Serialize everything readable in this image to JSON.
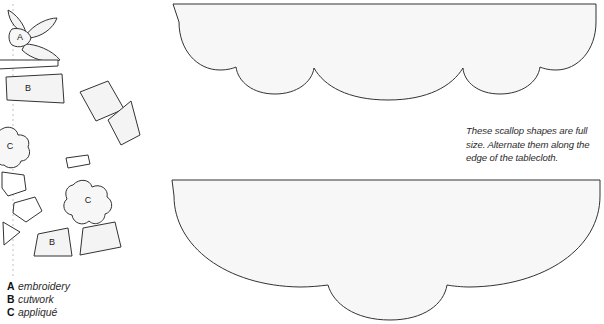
{
  "page": {
    "width": 604,
    "height": 324,
    "background": "#ffffff"
  },
  "colors": {
    "outline": "#333333",
    "shape_fill": "#f4f4f4",
    "scallop_fill": "#f7f7f7",
    "fold_line": "#cccccc",
    "text": "#2b2b2b",
    "key_text": "#111111"
  },
  "note": {
    "text": "These scallop shapes are full size. Alternate them along the edge of the tablecloth."
  },
  "legend": {
    "items": [
      {
        "key": "A",
        "description": "embroidery"
      },
      {
        "key": "B",
        "description": "cutwork"
      },
      {
        "key": "C",
        "description": "appliqué"
      }
    ]
  },
  "fold_line": {
    "label": "fold-line",
    "x": 13,
    "y_start": 4,
    "y_end": 276,
    "dash": "2 3"
  },
  "motif_labels": {
    "leaf_cluster": "A",
    "band_upper": "B",
    "band_lower": "B",
    "flower_edge": "C",
    "flower_center": "C"
  },
  "scallops": [
    {
      "name": "scallop-template-top",
      "lobes": 3,
      "center_lobe": "large",
      "cusp_x": [
        313,
        463
      ],
      "top_y": 4,
      "bottom_y": 118
    },
    {
      "name": "scallop-template-bottom",
      "lobes": 3,
      "center_lobe": "small",
      "cusp_x": [
        327,
        447
      ],
      "top_y": 180,
      "bottom_y": 320
    }
  ]
}
